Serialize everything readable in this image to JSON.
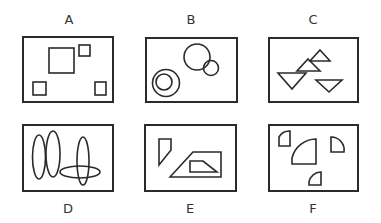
{
  "panels": [
    {
      "id": "A",
      "label": "A",
      "shapes": "squares"
    },
    {
      "id": "B",
      "label": "B",
      "shapes": "circles"
    },
    {
      "id": "C",
      "label": "C",
      "shapes": "triangles"
    },
    {
      "id": "D",
      "label": "D",
      "shapes": "ellipses"
    },
    {
      "id": "E",
      "label": "E",
      "shapes": "quadrilaterals-and-triangle"
    },
    {
      "id": "F",
      "label": "F",
      "shapes": "quarter-circles"
    }
  ],
  "colors": {
    "stroke": "#2a2a2a",
    "label": "#333333"
  }
}
